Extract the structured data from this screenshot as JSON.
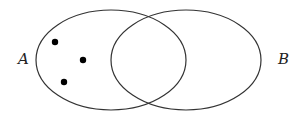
{
  "diagram": {
    "type": "venn",
    "sets": [
      {
        "id": "A",
        "label": "A",
        "cx": 111,
        "cy": 60,
        "rx": 75,
        "ry": 50
      },
      {
        "id": "B",
        "label": "B",
        "cx": 186,
        "cy": 60,
        "rx": 75,
        "ry": 50
      }
    ],
    "labels": [
      {
        "text": "A",
        "x": 18,
        "y": 64
      },
      {
        "text": "B",
        "x": 278,
        "y": 64
      }
    ],
    "points": [
      {
        "x": 55,
        "y": 42,
        "region": "A only"
      },
      {
        "x": 83,
        "y": 60,
        "region": "A only"
      },
      {
        "x": 64,
        "y": 82,
        "region": "A only"
      }
    ],
    "colors": {
      "stroke": "#333333",
      "dot": "#000000",
      "background": "#ffffff"
    }
  }
}
